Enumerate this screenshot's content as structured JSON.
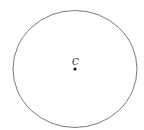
{
  "diagram": {
    "type": "circle-with-center",
    "center_label": "C",
    "circle": {
      "cx": 75,
      "cy": 69,
      "rx": 62,
      "ry": 58.5,
      "stroke": "#7a7a7a"
    },
    "center_point": {
      "x": 75,
      "y": 69,
      "color": "#111111"
    }
  }
}
